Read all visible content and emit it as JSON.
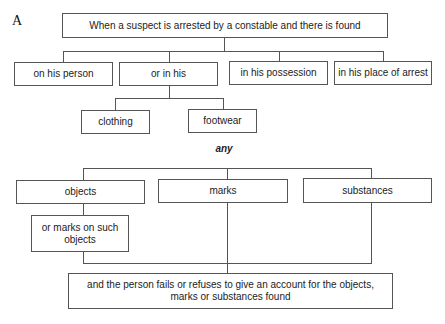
{
  "figure_label": "A",
  "diagram": {
    "root": "When a suspect is arrested by a constable and there is found",
    "locations": [
      "on his person",
      "or in his",
      "in his possession",
      "in his place of arrest"
    ],
    "in_his_items": [
      "clothing",
      "footwear"
    ],
    "connector_word": "any",
    "findings": [
      "objects",
      "marks",
      "substances"
    ],
    "objects_sub_lines": [
      "or marks on such",
      "objects"
    ],
    "conclusion_lines": [
      "and the person fails or refuses to give an account for the objects,",
      "marks or substances found"
    ]
  }
}
